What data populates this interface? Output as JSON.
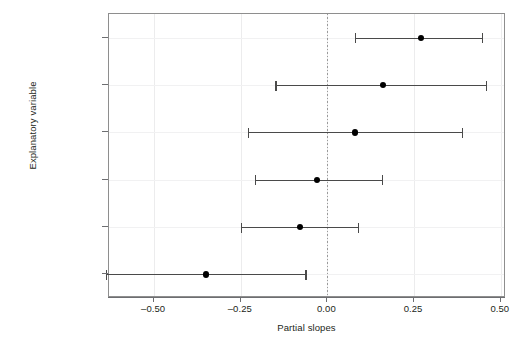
{
  "chart_data": {
    "type": "scatter",
    "title": "",
    "xlabel": "Partial slopes",
    "ylabel": "Explanatory variable",
    "xlim": [
      -0.63,
      0.515
    ],
    "xticks": [
      -0.5,
      -0.25,
      0.0,
      0.25,
      0.5
    ],
    "xticklabels": [
      "–0.50",
      "–0.25",
      "0.00",
      "0.25",
      "0.50"
    ],
    "grid": true,
    "reference_line": 0.0,
    "reference_line_style": "dotted",
    "categories": [
      "ManufEnter",
      "AvgPrecip",
      "AvgRainyDays",
      "Population1970",
      "AvgWindSpeed",
      "Temp"
    ],
    "series": [
      {
        "name": "Partial slope estimate",
        "values": [
          0.27,
          0.16,
          0.08,
          -0.03,
          -0.08,
          -0.35
        ]
      },
      {
        "name": "Lower confidence limit",
        "values": [
          0.08,
          -0.15,
          -0.23,
          -0.21,
          -0.25,
          -0.64
        ]
      },
      {
        "name": "Upper confidence limit",
        "values": [
          0.45,
          0.46,
          0.39,
          0.16,
          0.09,
          -0.06
        ]
      }
    ],
    "points": [
      {
        "label": "ManufEnter",
        "estimate": 0.27,
        "low": 0.08,
        "high": 0.45
      },
      {
        "label": "AvgPrecip",
        "estimate": 0.16,
        "low": -0.15,
        "high": 0.46
      },
      {
        "label": "AvgRainyDays",
        "estimate": 0.08,
        "low": -0.23,
        "high": 0.39
      },
      {
        "label": "Population1970",
        "estimate": -0.03,
        "low": -0.21,
        "high": 0.16
      },
      {
        "label": "AvgWindSpeed",
        "estimate": -0.08,
        "low": -0.25,
        "high": 0.09
      },
      {
        "label": "Temp",
        "estimate": -0.35,
        "low": -0.64,
        "high": -0.06
      }
    ],
    "colors": {
      "point": "#000000",
      "interval": "#4a4a4a",
      "grid": "#ececed",
      "frame": "#8e8e8e",
      "zero_line": "#9a9a9a",
      "text": "#231f20",
      "background": "#ffffff"
    }
  }
}
